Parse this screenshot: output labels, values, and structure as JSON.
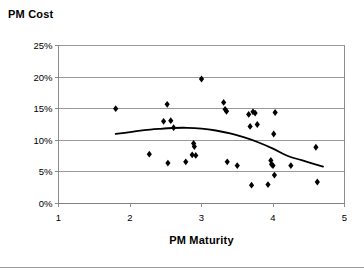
{
  "chart_data": {
    "type": "scatter",
    "title": "PM Cost",
    "xlabel": "PM Maturity",
    "ylabel": "PM Cost",
    "xlim": [
      1,
      5
    ],
    "ylim": [
      0,
      0.25
    ],
    "xticks": [
      "1",
      "2",
      "3",
      "4",
      "5"
    ],
    "xtick_values": [
      1,
      2,
      3,
      4,
      5
    ],
    "yticks": [
      "0%",
      "5%",
      "10%",
      "15%",
      "20%",
      "25%"
    ],
    "ytick_values": [
      0,
      0.05,
      0.1,
      0.15,
      0.2,
      0.25
    ],
    "grid": "horizontal",
    "legend": "none",
    "marker": "diamond",
    "marker_color": "#000000",
    "series": [
      {
        "name": "PM Cost vs PM Maturity",
        "points": [
          [
            1.8,
            0.15
          ],
          [
            2.27,
            0.078
          ],
          [
            2.47,
            0.13
          ],
          [
            2.52,
            0.157
          ],
          [
            2.53,
            0.064
          ],
          [
            2.57,
            0.131
          ],
          [
            2.61,
            0.12
          ],
          [
            2.78,
            0.066
          ],
          [
            2.87,
            0.077
          ],
          [
            2.89,
            0.095
          ],
          [
            2.9,
            0.09
          ],
          [
            2.92,
            0.076
          ],
          [
            3.0,
            0.197
          ],
          [
            3.31,
            0.16
          ],
          [
            3.33,
            0.149
          ],
          [
            3.35,
            0.146
          ],
          [
            3.36,
            0.066
          ],
          [
            3.5,
            0.06
          ],
          [
            3.66,
            0.141
          ],
          [
            3.68,
            0.122
          ],
          [
            3.7,
            0.029
          ],
          [
            3.72,
            0.145
          ],
          [
            3.75,
            0.143
          ],
          [
            3.78,
            0.125
          ],
          [
            3.93,
            0.03
          ],
          [
            3.97,
            0.068
          ],
          [
            3.98,
            0.062
          ],
          [
            4.0,
            0.06
          ],
          [
            4.01,
            0.11
          ],
          [
            4.02,
            0.045
          ],
          [
            4.03,
            0.144
          ],
          [
            4.25,
            0.06
          ],
          [
            4.6,
            0.089
          ],
          [
            4.62,
            0.034
          ]
        ]
      }
    ],
    "trendline": {
      "type": "polynomial",
      "order": 2,
      "color": "#000000",
      "x_range": [
        1.8,
        4.7
      ],
      "points": [
        [
          1.8,
          0.11
        ],
        [
          2.0,
          0.113
        ],
        [
          2.2,
          0.116
        ],
        [
          2.4,
          0.118
        ],
        [
          2.6,
          0.1195
        ],
        [
          2.8,
          0.1198
        ],
        [
          3.0,
          0.1185
        ],
        [
          3.2,
          0.1155
        ],
        [
          3.4,
          0.111
        ],
        [
          3.6,
          0.1045
        ],
        [
          3.8,
          0.0965
        ],
        [
          4.0,
          0.0868
        ],
        [
          4.2,
          0.0755
        ],
        [
          4.4,
          0.0685
        ],
        [
          4.7,
          0.0585
        ]
      ]
    }
  }
}
